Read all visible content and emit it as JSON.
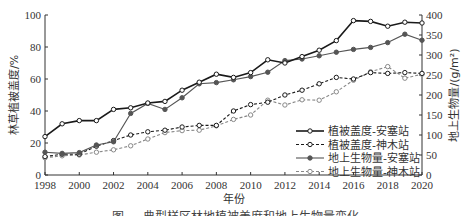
{
  "chart_data": {
    "type": "line",
    "title": "",
    "xlabel": "年份",
    "ylabel": "林草植被盖度/%",
    "ylabel_right": "地上生物量/(g/m²)",
    "x": [
      1998,
      1999,
      2000,
      2001,
      2002,
      2003,
      2004,
      2005,
      2006,
      2007,
      2008,
      2009,
      2010,
      2011,
      2012,
      2013,
      2014,
      2015,
      2016,
      2017,
      2018,
      2019,
      2020
    ],
    "xlim": [
      1998,
      2020
    ],
    "x_ticks": [
      "1998",
      "2000",
      "2002",
      "2004",
      "2006",
      "2008",
      "2010",
      "2012",
      "2014",
      "2016",
      "2018",
      "2020"
    ],
    "ylim": [
      0,
      100
    ],
    "y_ticks": [
      "0",
      "20",
      "40",
      "60",
      "80",
      "100"
    ],
    "ylim_right": [
      0,
      400
    ],
    "y_ticks_right": [
      "0",
      "50",
      "100",
      "150",
      "200",
      "250",
      "300",
      "350",
      "400"
    ],
    "grid": false,
    "legend_position": "lower right",
    "series": [
      {
        "name": "植被盖度-安塞站",
        "axis": "left",
        "style": "solid-open-marker",
        "color": "#1a1a1a",
        "values": [
          24,
          32,
          34,
          34,
          41,
          42,
          45,
          46,
          53,
          58,
          63,
          61,
          64,
          72,
          70,
          74,
          78,
          84,
          96.5,
          96,
          93,
          95.5,
          95
        ]
      },
      {
        "name": "植被盖度-神木站",
        "axis": "left",
        "style": "dashed-open-marker",
        "color": "#1a1a1a",
        "values": [
          11.5,
          13,
          13,
          18,
          21.5,
          25,
          27,
          28,
          30,
          31,
          31,
          40,
          44,
          45.5,
          50,
          53,
          57,
          61,
          60,
          64,
          63.5,
          64,
          63.5
        ]
      },
      {
        "name": "地上生物量-安塞站",
        "axis": "right",
        "style": "solid-filled-marker",
        "color": "#555555",
        "values": [
          57,
          54,
          56,
          75,
          83,
          154,
          179,
          164,
          193,
          228,
          231,
          238,
          246,
          257,
          286,
          290,
          298,
          307,
          314,
          319,
          331,
          352,
          337
        ]
      },
      {
        "name": "地上生物量-神木站",
        "axis": "right",
        "style": "dashed-open-marker",
        "color": "#888888",
        "values": [
          43,
          48,
          50,
          57,
          63,
          73,
          90,
          106,
          111,
          112,
          123,
          139,
          150,
          187,
          175,
          188,
          187,
          208,
          237,
          258,
          271,
          242,
          252
        ]
      }
    ]
  },
  "figure": {
    "caption": "图 … 典型样区林地植被盖度和地上生物量变化"
  }
}
